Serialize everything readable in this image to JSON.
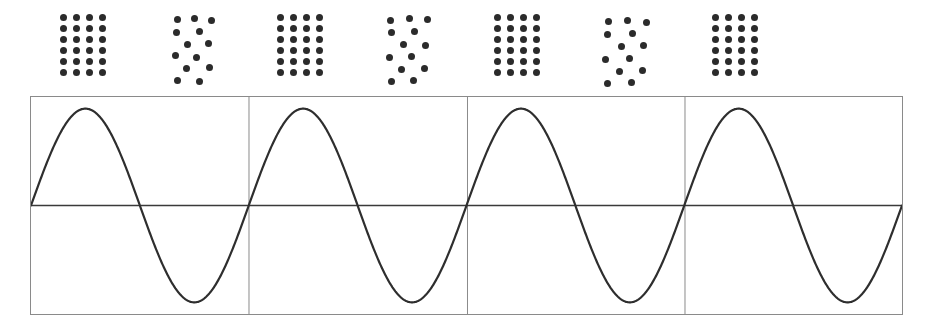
{
  "figure": {
    "background_color": "#ffffff",
    "width": 931,
    "height": 330
  },
  "dot_row": {
    "label": "dot-pattern-row",
    "dot_color": "#2b2b2b",
    "dot_diameter": 7,
    "groups": [
      {
        "index": 1,
        "type": "ordered-grid",
        "label": "ordered grid 4 by 6",
        "count": 24,
        "origin_x": 60,
        "origin_y": 14,
        "cols": 4,
        "rows": 6,
        "col_spacing": 13,
        "row_spacing": 11,
        "points": [
          [
            0,
            0
          ],
          [
            1,
            0
          ],
          [
            2,
            0
          ],
          [
            3,
            0
          ],
          [
            0,
            1
          ],
          [
            1,
            1
          ],
          [
            2,
            1
          ],
          [
            3,
            1
          ],
          [
            0,
            2
          ],
          [
            1,
            2
          ],
          [
            2,
            2
          ],
          [
            3,
            2
          ],
          [
            0,
            3
          ],
          [
            1,
            3
          ],
          [
            2,
            3
          ],
          [
            3,
            3
          ],
          [
            0,
            4
          ],
          [
            1,
            4
          ],
          [
            2,
            4
          ],
          [
            3,
            4
          ],
          [
            0,
            5
          ],
          [
            1,
            5
          ],
          [
            2,
            5
          ],
          [
            3,
            5
          ]
        ]
      },
      {
        "index": 2,
        "type": "scattered",
        "label": "scattered random cluster",
        "count": 14,
        "origin_x": 172,
        "origin_y": 14,
        "points_px": [
          [
            2,
            2
          ],
          [
            19,
            1
          ],
          [
            36,
            3
          ],
          [
            1,
            15
          ],
          [
            24,
            14
          ],
          [
            12,
            27
          ],
          [
            33,
            26
          ],
          [
            0,
            38
          ],
          [
            21,
            40
          ],
          [
            11,
            51
          ],
          [
            34,
            50
          ],
          [
            2,
            63
          ],
          [
            24,
            64
          ]
        ]
      },
      {
        "index": 3,
        "type": "ordered-grid",
        "label": "ordered grid 4 by 6",
        "count": 24,
        "origin_x": 277,
        "origin_y": 14,
        "cols": 4,
        "rows": 6,
        "col_spacing": 13,
        "row_spacing": 11,
        "points": [
          [
            0,
            0
          ],
          [
            1,
            0
          ],
          [
            2,
            0
          ],
          [
            3,
            0
          ],
          [
            0,
            1
          ],
          [
            1,
            1
          ],
          [
            2,
            1
          ],
          [
            3,
            1
          ],
          [
            0,
            2
          ],
          [
            1,
            2
          ],
          [
            2,
            2
          ],
          [
            3,
            2
          ],
          [
            0,
            3
          ],
          [
            1,
            3
          ],
          [
            2,
            3
          ],
          [
            3,
            3
          ],
          [
            0,
            4
          ],
          [
            1,
            4
          ],
          [
            2,
            4
          ],
          [
            3,
            4
          ],
          [
            0,
            5
          ],
          [
            1,
            5
          ],
          [
            2,
            5
          ],
          [
            3,
            5
          ]
        ]
      },
      {
        "index": 4,
        "type": "scattered",
        "label": "scattered random cluster",
        "count": 13,
        "origin_x": 385,
        "origin_y": 14,
        "points_px": [
          [
            2,
            3
          ],
          [
            21,
            1
          ],
          [
            39,
            2
          ],
          [
            3,
            15
          ],
          [
            26,
            14
          ],
          [
            15,
            27
          ],
          [
            37,
            28
          ],
          [
            1,
            40
          ],
          [
            23,
            39
          ],
          [
            13,
            52
          ],
          [
            36,
            51
          ],
          [
            3,
            64
          ],
          [
            25,
            63
          ]
        ]
      },
      {
        "index": 5,
        "type": "ordered-grid",
        "label": "ordered grid 4 by 6",
        "count": 24,
        "origin_x": 494,
        "origin_y": 14,
        "cols": 4,
        "rows": 6,
        "col_spacing": 13,
        "row_spacing": 11,
        "points": [
          [
            0,
            0
          ],
          [
            1,
            0
          ],
          [
            2,
            0
          ],
          [
            3,
            0
          ],
          [
            0,
            1
          ],
          [
            1,
            1
          ],
          [
            2,
            1
          ],
          [
            3,
            1
          ],
          [
            0,
            2
          ],
          [
            1,
            2
          ],
          [
            2,
            2
          ],
          [
            3,
            2
          ],
          [
            0,
            3
          ],
          [
            1,
            3
          ],
          [
            2,
            3
          ],
          [
            3,
            3
          ],
          [
            0,
            4
          ],
          [
            1,
            4
          ],
          [
            2,
            4
          ],
          [
            3,
            4
          ],
          [
            0,
            5
          ],
          [
            1,
            5
          ],
          [
            2,
            5
          ],
          [
            3,
            5
          ]
        ]
      },
      {
        "index": 6,
        "type": "scattered",
        "label": "scattered random cluster",
        "count": 13,
        "origin_x": 602,
        "origin_y": 16,
        "points_px": [
          [
            3,
            2
          ],
          [
            22,
            1
          ],
          [
            41,
            3
          ],
          [
            2,
            15
          ],
          [
            27,
            14
          ],
          [
            16,
            27
          ],
          [
            38,
            26
          ],
          [
            0,
            40
          ],
          [
            24,
            39
          ],
          [
            14,
            52
          ],
          [
            37,
            51
          ],
          [
            2,
            64
          ],
          [
            26,
            63
          ]
        ]
      },
      {
        "index": 7,
        "type": "ordered-grid",
        "label": "ordered grid 4 by 6",
        "count": 24,
        "origin_x": 712,
        "origin_y": 14,
        "cols": 4,
        "rows": 6,
        "col_spacing": 13,
        "row_spacing": 11,
        "points": [
          [
            0,
            0
          ],
          [
            1,
            0
          ],
          [
            2,
            0
          ],
          [
            3,
            0
          ],
          [
            0,
            1
          ],
          [
            1,
            1
          ],
          [
            2,
            1
          ],
          [
            3,
            1
          ],
          [
            0,
            2
          ],
          [
            1,
            2
          ],
          [
            2,
            2
          ],
          [
            3,
            2
          ],
          [
            0,
            3
          ],
          [
            1,
            3
          ],
          [
            2,
            3
          ],
          [
            3,
            3
          ],
          [
            0,
            4
          ],
          [
            1,
            4
          ],
          [
            2,
            4
          ],
          [
            3,
            4
          ],
          [
            0,
            5
          ],
          [
            1,
            5
          ],
          [
            2,
            5
          ],
          [
            3,
            5
          ]
        ]
      }
    ]
  },
  "chart_data": {
    "type": "line",
    "title": "",
    "xlabel": "",
    "ylabel": "",
    "x": [
      0,
      0.25,
      0.5,
      0.75,
      1,
      1.25,
      1.5,
      1.75,
      2,
      2.25,
      2.5,
      2.75,
      3,
      3.25,
      3.5,
      3.75,
      4
    ],
    "series": [
      {
        "name": "sine",
        "function": "sin(2*pi*x)",
        "amplitude": 1,
        "periods": 4,
        "values": [
          0,
          1,
          0,
          -1,
          0,
          1,
          0,
          -1,
          0,
          1,
          0,
          -1,
          0,
          1,
          0,
          -1,
          0
        ]
      }
    ],
    "ylim": [
      -1.12,
      1.12
    ],
    "xlim": [
      0,
      4
    ],
    "grid": false,
    "legend": "none",
    "zero_crossings": [
      0,
      1,
      2,
      3,
      4
    ],
    "peaks_x": [
      0.25,
      1.25,
      2.25,
      3.25
    ],
    "troughs_x": [
      0.75,
      1.75,
      2.75,
      3.75
    ]
  },
  "wave_panel": {
    "label": "sine-wave-panel",
    "border_color": "#8a8a8a",
    "axis_color": "#3a3a3a",
    "wave_color": "#2e2e2e",
    "cell_count": 4,
    "divider_count": 3
  }
}
